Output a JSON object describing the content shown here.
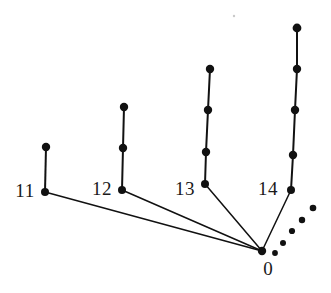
{
  "figure": {
    "type": "graph-diagram",
    "subtype": "spider-tree",
    "background_color": "#ffffff",
    "ink_color": "#111111",
    "width": 331,
    "height": 293
  },
  "hub": {
    "id": "0",
    "label": "0",
    "x": 262,
    "y": 251,
    "radius": 4.2,
    "label_x": 268,
    "label_y": 268
  },
  "legs": [
    {
      "id": "leg-11",
      "label": "11",
      "label_x": 25,
      "label_y": 190,
      "nodes": [
        {
          "x": 45,
          "y": 192,
          "radius": 4.0
        },
        {
          "x": 46,
          "y": 147,
          "radius": 4.2
        }
      ]
    },
    {
      "id": "leg-12",
      "label": "12",
      "label_x": 102,
      "label_y": 188,
      "nodes": [
        {
          "x": 122,
          "y": 190,
          "radius": 4.0
        },
        {
          "x": 123,
          "y": 148,
          "radius": 4.2
        },
        {
          "x": 124,
          "y": 107,
          "radius": 4.2
        }
      ]
    },
    {
      "id": "leg-13",
      "label": "13",
      "label_x": 185,
      "label_y": 188,
      "nodes": [
        {
          "x": 205,
          "y": 184,
          "radius": 4.0
        },
        {
          "x": 206,
          "y": 152,
          "radius": 4.2
        },
        {
          "x": 208,
          "y": 110,
          "radius": 4.2
        },
        {
          "x": 210,
          "y": 69,
          "radius": 4.2
        }
      ]
    },
    {
      "id": "leg-14",
      "label": "14",
      "label_x": 268,
      "label_y": 188,
      "nodes": [
        {
          "x": 291,
          "y": 190,
          "radius": 4.0
        },
        {
          "x": 293,
          "y": 155,
          "radius": 4.2
        },
        {
          "x": 295,
          "y": 110,
          "radius": 4.2
        },
        {
          "x": 297,
          "y": 69,
          "radius": 4.2
        },
        {
          "x": 297,
          "y": 28,
          "radius": 4.4
        }
      ]
    }
  ],
  "ellipsis_dots": [
    {
      "x": 275,
      "y": 253,
      "radius": 2.9
    },
    {
      "x": 283,
      "y": 243,
      "radius": 3.0
    },
    {
      "x": 292,
      "y": 231,
      "radius": 3.1
    },
    {
      "x": 302,
      "y": 220,
      "radius": 3.2
    },
    {
      "x": 313,
      "y": 208,
      "radius": 3.3
    }
  ],
  "speck": {
    "x": 234,
    "y": 16,
    "radius": 1.2,
    "color": "#c9c9c9"
  }
}
